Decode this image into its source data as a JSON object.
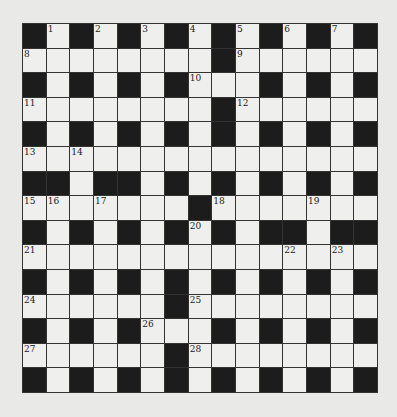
{
  "puzzle": {
    "type": "crossword",
    "rows": 15,
    "cols": 15,
    "colors": {
      "black": "#1c1c1c",
      "white": "#efefed",
      "background": "#e9e9e7",
      "line": "#333333"
    },
    "layout": [
      "#.#.#.#.#.#.#.#",
      "........#......",
      "#.#.#.#...#.#.#",
      "........#......",
      "#.#.#.#.#.#.#.#",
      "...............",
      "##.##.#.#.#.#.#",
      ".......#.......",
      "#.#.#.#.#.##.##",
      "...............",
      "#.#.#.#.#.#.#.#",
      "......#........",
      "#.#.#...#.#.#.#",
      "......#........",
      "#.#.#.#.#.#.#.#"
    ],
    "numbers": [
      {
        "r": 0,
        "c": 1,
        "n": "1"
      },
      {
        "r": 0,
        "c": 3,
        "n": "2"
      },
      {
        "r": 0,
        "c": 5,
        "n": "3"
      },
      {
        "r": 0,
        "c": 7,
        "n": "4"
      },
      {
        "r": 0,
        "c": 9,
        "n": "5"
      },
      {
        "r": 0,
        "c": 11,
        "n": "6"
      },
      {
        "r": 0,
        "c": 13,
        "n": "7"
      },
      {
        "r": 1,
        "c": 0,
        "n": "8"
      },
      {
        "r": 1,
        "c": 9,
        "n": "9"
      },
      {
        "r": 2,
        "c": 7,
        "n": "10"
      },
      {
        "r": 3,
        "c": 0,
        "n": "11"
      },
      {
        "r": 3,
        "c": 9,
        "n": "12"
      },
      {
        "r": 5,
        "c": 0,
        "n": "13"
      },
      {
        "r": 5,
        "c": 2,
        "n": "14"
      },
      {
        "r": 7,
        "c": 0,
        "n": "15"
      },
      {
        "r": 7,
        "c": 1,
        "n": "16"
      },
      {
        "r": 7,
        "c": 3,
        "n": "17"
      },
      {
        "r": 7,
        "c": 8,
        "n": "18"
      },
      {
        "r": 7,
        "c": 12,
        "n": "19"
      },
      {
        "r": 8,
        "c": 7,
        "n": "20"
      },
      {
        "r": 9,
        "c": 0,
        "n": "21"
      },
      {
        "r": 9,
        "c": 11,
        "n": "22"
      },
      {
        "r": 9,
        "c": 13,
        "n": "23"
      },
      {
        "r": 11,
        "c": 0,
        "n": "24"
      },
      {
        "r": 11,
        "c": 7,
        "n": "25"
      },
      {
        "r": 12,
        "c": 5,
        "n": "26"
      },
      {
        "r": 13,
        "c": 0,
        "n": "27"
      },
      {
        "r": 13,
        "c": 7,
        "n": "28"
      }
    ]
  }
}
